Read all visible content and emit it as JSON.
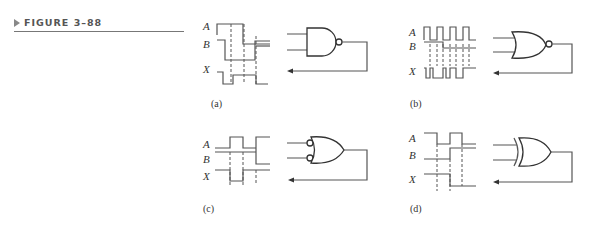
{
  "figure": {
    "label": "FIGURE 3–88",
    "marker_icon": "triangle-right-icon"
  },
  "panels": [
    {
      "id": "a",
      "caption": "(a)",
      "gate": "NAND",
      "signals": [
        "A",
        "B",
        "X"
      ]
    },
    {
      "id": "b",
      "caption": "(b)",
      "gate": "NOR",
      "signals": [
        "A",
        "B",
        "X"
      ]
    },
    {
      "id": "c",
      "caption": "(c)",
      "gate": "OR with inverted inputs",
      "signals": [
        "A",
        "B",
        "X"
      ]
    },
    {
      "id": "d",
      "caption": "(d)",
      "gate": "XOR",
      "signals": [
        "A",
        "B",
        "X"
      ]
    }
  ],
  "colors": {
    "line": "#555555",
    "gate": "#333333",
    "background": "#ffffff"
  }
}
